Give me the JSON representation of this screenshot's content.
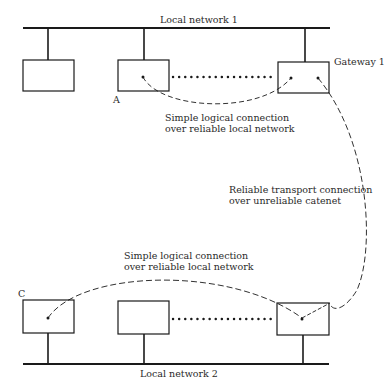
{
  "diagram": {
    "type": "network-architecture",
    "networks": [
      {
        "id": "net1",
        "label": "Local network 1"
      },
      {
        "id": "net2",
        "label": "Local network 2"
      }
    ],
    "hosts": {
      "a": {
        "label": "A"
      },
      "c": {
        "label": "C"
      },
      "gateway1": {
        "label": "Gateway 1"
      }
    },
    "annotations": {
      "top_connection": {
        "line1": "Simple logical connection",
        "line2": "over reliable local network"
      },
      "transport_connection": {
        "line1": "Reliable transport connection",
        "line2": "over unreliable catenet"
      },
      "bottom_connection": {
        "line1": "Simple logical connection",
        "line2": "over reliable local network"
      }
    },
    "colors": {
      "line": "#1a1a1a",
      "text": "#2a2a2a",
      "background": "#ffffff"
    }
  }
}
